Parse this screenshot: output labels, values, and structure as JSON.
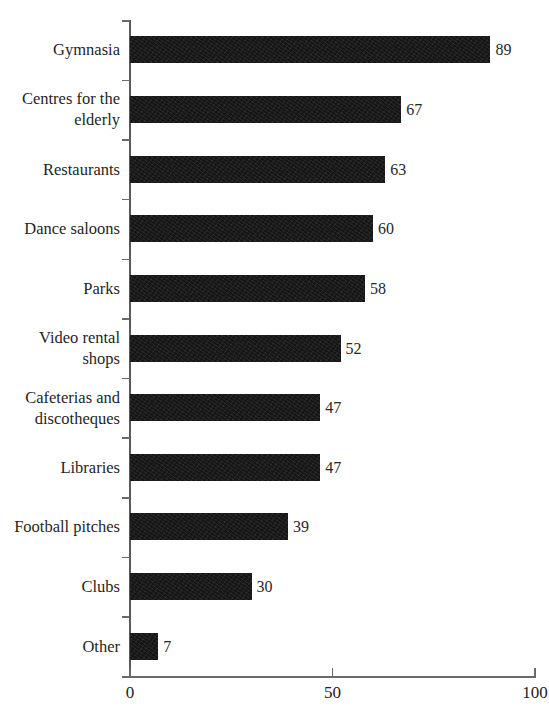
{
  "chart_data": {
    "type": "bar",
    "orientation": "horizontal",
    "title": "",
    "subtitle": "",
    "xlabel": "",
    "ylabel": "",
    "xlim": [
      0,
      100
    ],
    "x_ticks": [
      "0",
      "50",
      "100"
    ],
    "x_tick_values": [
      0,
      50,
      100
    ],
    "grid": false,
    "legend": null,
    "bar_color": "#151515",
    "axis_color": "#6a6a6a",
    "text_color": "#1f1f1f",
    "show_value_labels": true,
    "categories": [
      "Gymnasia",
      "Centres for the elderly",
      "Restaurants",
      "Dance saloons",
      "Parks",
      "Video rental shops",
      "Cafeterias and discotheques",
      "Libraries",
      "Football pitches",
      "Clubs",
      "Other"
    ],
    "values": [
      89,
      67,
      63,
      60,
      58,
      52,
      47,
      47,
      39,
      30,
      7
    ],
    "value_labels": [
      "89",
      "67",
      "63",
      "60",
      "58",
      "52",
      "47",
      "47",
      "39",
      "30",
      "7"
    ]
  }
}
